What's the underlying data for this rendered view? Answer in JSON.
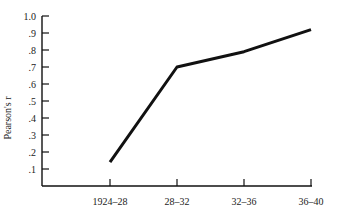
{
  "chart_data": {
    "type": "line",
    "title": "",
    "xlabel": "",
    "ylabel": "Pearson's r",
    "categories": [
      "1924–28",
      "28–32",
      "32–36",
      "36–40"
    ],
    "series": [
      {
        "name": "Pearson's r",
        "values": [
          0.14,
          0.7,
          0.79,
          0.92
        ]
      }
    ],
    "yticks": [
      "1.0",
      ".9",
      ".8",
      ".7",
      ".6",
      ".5",
      ".4",
      ".3",
      ".2",
      ".1"
    ],
    "ytick_values": [
      1.0,
      0.9,
      0.8,
      0.7,
      0.6,
      0.5,
      0.4,
      0.3,
      0.2,
      0.1
    ],
    "ylim": [
      0,
      1.0
    ],
    "grid": false,
    "legend": "none"
  },
  "colors": {
    "line": "#111111",
    "axis": "#111111"
  }
}
